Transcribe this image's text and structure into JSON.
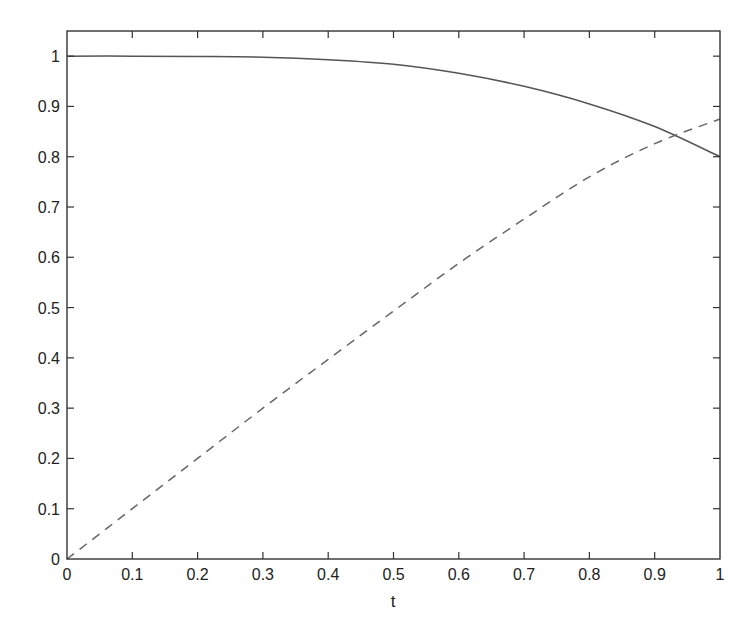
{
  "chart_data": {
    "type": "line",
    "title": "",
    "xlabel": "t",
    "ylabel": "",
    "xlim": [
      0,
      1
    ],
    "ylim": [
      0,
      1.05
    ],
    "grid": false,
    "legend": null,
    "x_ticks": [
      0,
      0.1,
      0.2,
      0.3,
      0.4,
      0.5,
      0.6,
      0.7,
      0.8,
      0.9,
      1
    ],
    "x_tick_labels": [
      "0",
      "0.1",
      "0.2",
      "0.3",
      "0.4",
      "0.5",
      "0.6",
      "0.7",
      "0.8",
      "0.9",
      "1"
    ],
    "y_ticks": [
      0,
      0.1,
      0.2,
      0.3,
      0.4,
      0.5,
      0.6,
      0.7,
      0.8,
      0.9,
      1
    ],
    "y_tick_labels": [
      "0",
      "0.1",
      "0.2",
      "0.3",
      "0.4",
      "0.5",
      "0.6",
      "0.7",
      "0.8",
      "0.9",
      "1"
    ],
    "x": [
      0,
      0.1,
      0.2,
      0.3,
      0.4,
      0.5,
      0.6,
      0.7,
      0.8,
      0.9,
      1
    ],
    "series": [
      {
        "name": "solid",
        "style": "solid",
        "color": "#555555",
        "values": [
          1.0,
          1.0,
          0.9995,
          0.998,
          0.993,
          0.984,
          0.966,
          0.94,
          0.905,
          0.86,
          0.8
        ]
      },
      {
        "name": "dashed",
        "style": "dashed",
        "color": "#666666",
        "values": [
          0.0,
          0.1,
          0.2,
          0.3,
          0.397,
          0.493,
          0.588,
          0.676,
          0.76,
          0.826,
          0.875
        ]
      }
    ],
    "annotations": []
  },
  "axes": {
    "x_label": "t"
  }
}
